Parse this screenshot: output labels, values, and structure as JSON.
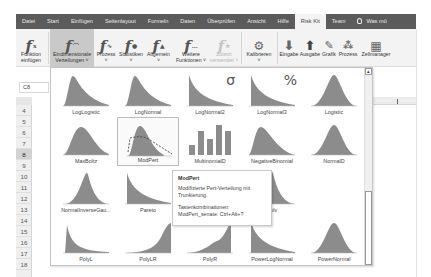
{
  "tabs": [
    {
      "label": "Datei",
      "active": false
    },
    {
      "label": "Start",
      "active": false
    },
    {
      "label": "Einfügen",
      "active": false
    },
    {
      "label": "Seitenlayout",
      "active": false
    },
    {
      "label": "Formeln",
      "active": false
    },
    {
      "label": "Daten",
      "active": false
    },
    {
      "label": "Überprüfen",
      "active": false
    },
    {
      "label": "Ansicht",
      "active": false
    },
    {
      "label": "Hilfe",
      "active": false
    },
    {
      "label": "Risk Kit",
      "active": true
    },
    {
      "label": "Team",
      "active": false
    }
  ],
  "tell_me": {
    "label": "Was möchten Sie tun?",
    "display": "Was mö"
  },
  "ribbon": {
    "funktion_einfuegen": {
      "line1": "Funktion",
      "line2": "einfügen"
    },
    "eindimensionale": {
      "line1": "Eindimensionale",
      "line2": "Verteilungen ˅"
    },
    "prozess_fn": {
      "line1": "Prozess",
      "line2": "˅"
    },
    "statistiken": {
      "line1": "Statistiken",
      "line2": "˅"
    },
    "allgemein": {
      "line1": "Allgemein",
      "line2": "˅"
    },
    "weitere": {
      "line1": "Weitere",
      "line2": "Funktionen ˅"
    },
    "zuletzt": {
      "line1": "Zuletzt",
      "line2": "verwendet ˅"
    },
    "kalibrieren": {
      "line1": "Kalibrieren",
      "line2": "˅"
    },
    "eingabe": {
      "label": "Eingabe"
    },
    "ausgabe": {
      "label": "Ausgabe"
    },
    "grafik": {
      "label": "Grafik"
    },
    "prozess": {
      "label": "Prozess"
    },
    "zellmanager": {
      "label": "Zellmanager"
    }
  },
  "name_box": {
    "value": "C8"
  },
  "rows": [
    "4",
    "5",
    "6",
    "7",
    "8",
    "9",
    "10",
    "11",
    "12",
    "13",
    "14",
    "15",
    "16",
    "17",
    "18"
  ],
  "selected_row": "8",
  "gallery": {
    "items": [
      {
        "name": "LogLogistic",
        "shape": "rightskew"
      },
      {
        "name": "LogNormal",
        "shape": "rightskew"
      },
      {
        "name": "LogNormal2",
        "shape": "decay",
        "glyph": "σ"
      },
      {
        "name": "LogNormal3",
        "shape": "decay",
        "glyph": "%"
      },
      {
        "name": "Logistic",
        "shape": "peak"
      },
      {
        "name": "MaxBoltz",
        "shape": "wide"
      },
      {
        "name": "ModPert",
        "shape": "modpert",
        "hover": true
      },
      {
        "name": "MultinomialD",
        "shape": "bars"
      },
      {
        "name": "NegativeBinomial",
        "shape": "negbin"
      },
      {
        "name": "NormalD",
        "shape": "bell"
      },
      {
        "name": "NormalInverseGau...",
        "shape": "sharp"
      },
      {
        "name": "Pareto",
        "shape": "decay"
      },
      {
        "name": "PoissonD",
        "shape": "steps"
      },
      {
        "name": "Polv",
        "shape": "spike"
      },
      {
        "name": "",
        "shape": "none"
      },
      {
        "name": "PolyL",
        "shape": "polyl"
      },
      {
        "name": "PolyLR",
        "shape": "polylr"
      },
      {
        "name": "PolyR",
        "shape": "polyr"
      },
      {
        "name": "PowerLogNormal",
        "shape": "decay"
      },
      {
        "name": "PowerNormal",
        "shape": "bell"
      }
    ]
  },
  "tooltip": {
    "title": "ModPert",
    "description": "Modifizierte Pert-Verteilung mit Trunkierung.",
    "shortcut_heading": "Tastenkombinationen:",
    "shortcut": "ModPert_senate: Ctrl+Alt+?"
  },
  "colors": {
    "tabbar": "#5b5b5b",
    "ribbon": "#f3f3f3",
    "distribution_fill": "#8c8c8c",
    "selected_button": "#c9c9c9"
  }
}
